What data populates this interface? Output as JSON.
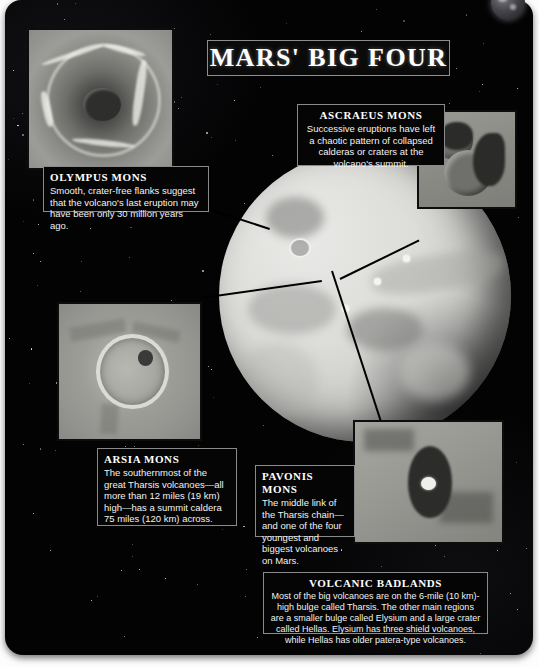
{
  "poster": {
    "title": "MARS' BIG FOUR",
    "background_color": "#030304",
    "accent_color": "#ffffff",
    "page_color": "#fdfdfd"
  },
  "globe": {
    "name": "mars-globe",
    "label": "Mars"
  },
  "callouts": [
    {
      "id": "olympus",
      "heading": "OLYMPUS MONS",
      "body": "Smooth, crater-free flanks suggest that the volcano's last eruption may have been only 30 million years ago.",
      "photo_name": "olympus-mons-photo"
    },
    {
      "id": "ascraeus",
      "heading": "ASCRAEUS MONS",
      "body": "Successive eruptions have left a chaotic pattern of collapsed calderas or craters at the volcano's summit.",
      "photo_name": "ascraeus-mons-photo"
    },
    {
      "id": "arsia",
      "heading": "ARSIA MONS",
      "body": "The southernmost of the great Tharsis volcanoes—all more than 12 miles (19 km) high—has a summit caldera 75 miles (120 km) across.",
      "photo_name": "arsia-mons-photo"
    },
    {
      "id": "pavonis",
      "heading": "PAVONIS MONS",
      "body": "The middle link of the Tharsis chain—and one of the four youngest and biggest volcanoes on Mars.",
      "photo_name": "pavonis-mons-photo"
    }
  ],
  "badlands": {
    "heading": "VOLCANIC BADLANDS",
    "body": "Most of the big volcanoes are on the 6-mile (10 km)-high bulge called Tharsis. The other main regions are a smaller bulge called Elysium and a large crater called Hellas. Elysium has three shield volcanoes, while Hellas has older patera-type volcanoes."
  }
}
